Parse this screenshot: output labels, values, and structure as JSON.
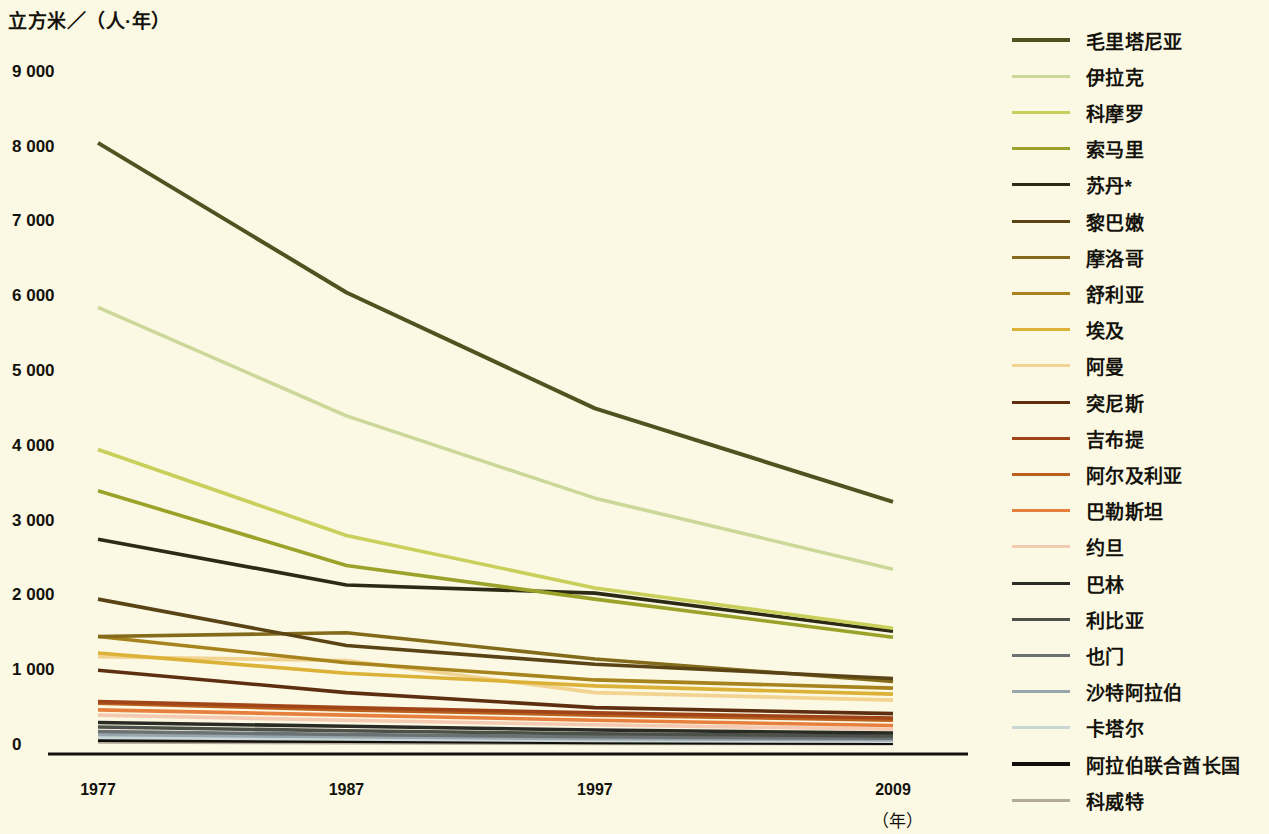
{
  "chart_data": {
    "type": "line",
    "title": "",
    "subtitle": "",
    "ylabel": "立方米／（人·年）",
    "xlabel": "（年）",
    "x": [
      1977,
      1987,
      1997,
      2009
    ],
    "xtick_labels": [
      "1977",
      "1987",
      "1997",
      "2009"
    ],
    "ytick_labels": [
      "0",
      "1 000",
      "2 000",
      "3 000",
      "4 000",
      "5 000",
      "6 000",
      "7 000",
      "8 000",
      "9 000"
    ],
    "yticks": [
      0,
      1000,
      2000,
      3000,
      4000,
      5000,
      6000,
      7000,
      8000,
      9000
    ],
    "ylim": [
      0,
      9400
    ],
    "xlim": [
      1975.5,
      2010.5
    ],
    "grid": false,
    "legend_position": "right",
    "background_color": "#fbf9e3",
    "axis_color": "#14120c",
    "series": [
      {
        "name": "毛里塔尼亚",
        "color": "#4e5320",
        "width": 4.0,
        "values": [
          8050,
          6050,
          4500,
          3250
        ]
      },
      {
        "name": "伊拉克",
        "color": "#ccd79a",
        "width": 3.6,
        "values": [
          5850,
          4400,
          3300,
          2350
        ]
      },
      {
        "name": "科摩罗",
        "color": "#c8cf5a",
        "width": 3.6,
        "values": [
          3950,
          2800,
          2100,
          1560
        ]
      },
      {
        "name": "索马里",
        "color": "#9aa229",
        "width": 3.6,
        "values": [
          3400,
          2400,
          1950,
          1440
        ]
      },
      {
        "name": "苏丹*",
        "color": "#2c2a14",
        "width": 3.6,
        "values": [
          2750,
          2140,
          2030,
          1520
        ]
      },
      {
        "name": "黎巴嫩",
        "color": "#5a4416",
        "width": 3.6,
        "values": [
          1950,
          1330,
          1080,
          890
        ]
      },
      {
        "name": "摩洛哥",
        "color": "#836b1b",
        "width": 3.6,
        "values": [
          1450,
          1500,
          1150,
          850
        ]
      },
      {
        "name": "舒利亚",
        "color": "#a6831c",
        "width": 3.6,
        "values": [
          1450,
          1100,
          870,
          760
        ]
      },
      {
        "name": "埃及",
        "color": "#dcb137",
        "width": 3.6,
        "values": [
          1230,
          960,
          790,
          680
        ]
      },
      {
        "name": "阿曼",
        "color": "#f2d391",
        "width": 3.6,
        "values": [
          1180,
          1130,
          700,
          600
        ]
      },
      {
        "name": "突尼斯",
        "color": "#5d2f10",
        "width": 3.6,
        "values": [
          1000,
          700,
          500,
          420
        ]
      },
      {
        "name": "吉布提",
        "color": "#a14519",
        "width": 3.6,
        "values": [
          580,
          500,
          430,
          360
        ]
      },
      {
        "name": "阿尔及利亚",
        "color": "#b9601f",
        "width": 3.6,
        "values": [
          560,
          470,
          400,
          330
        ]
      },
      {
        "name": "巴勒斯坦",
        "color": "#e7803f",
        "width": 3.6,
        "values": [
          470,
          400,
          330,
          260
        ]
      },
      {
        "name": "约旦",
        "color": "#f4cbb2",
        "width": 3.6,
        "values": [
          400,
          330,
          270,
          210
        ]
      },
      {
        "name": "巴林",
        "color": "#2b2b25",
        "width": 3.6,
        "values": [
          300,
          250,
          200,
          160
        ]
      },
      {
        "name": "利比亚",
        "color": "#4c5149",
        "width": 3.6,
        "values": [
          240,
          190,
          150,
          120
        ]
      },
      {
        "name": "也门",
        "color": "#6c7273",
        "width": 3.6,
        "values": [
          180,
          140,
          110,
          90
        ]
      },
      {
        "name": "沙特阿拉伯",
        "color": "#97a6ad",
        "width": 3.6,
        "values": [
          140,
          110,
          85,
          70
        ]
      },
      {
        "name": "卡塔尔",
        "color": "#c9d6d5",
        "width": 3.6,
        "values": [
          100,
          80,
          60,
          50
        ]
      },
      {
        "name": "阿拉伯联合酋长国",
        "color": "#110f0c",
        "width": 4.4,
        "values": [
          70,
          55,
          40,
          30
        ]
      },
      {
        "name": "科威特",
        "color": "#b3aa9a",
        "width": 3.6,
        "values": [
          40,
          30,
          22,
          18
        ]
      }
    ]
  },
  "legend": {
    "items": [
      "毛里塔尼亚",
      "伊拉克",
      "科摩罗",
      "索马里",
      "苏丹*",
      "黎巴嫩",
      "摩洛哥",
      "舒利亚",
      "埃及",
      "阿曼",
      "突尼斯",
      "吉布提",
      "阿尔及利亚",
      "巴勒斯坦",
      "约旦",
      "巴林",
      "利比亚",
      "也门",
      "沙特阿拉伯",
      "卡塔尔",
      "阿拉伯联合酋长国",
      "科威特"
    ]
  }
}
